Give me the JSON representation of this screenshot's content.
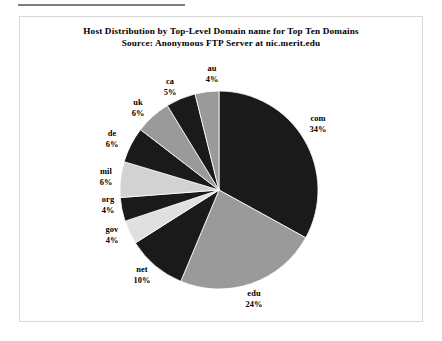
{
  "document": {
    "rule_present": true,
    "frame_present": true
  },
  "chart_data": {
    "type": "pie",
    "title": "Host Distribution by Top-Level Domain name for Top Ten Domains",
    "subtitle": "Source: Anonymous FTP Server at nic.merit.edu",
    "xlabel": "",
    "ylabel": "",
    "units": "percent",
    "legend": "none",
    "grid": false,
    "start_angle_deg": 0,
    "direction": "clockwise",
    "categories": [
      "com",
      "edu",
      "net",
      "gov",
      "org",
      "mil",
      "de",
      "uk",
      "ca",
      "au"
    ],
    "values": [
      34,
      24,
      10,
      4,
      4,
      6,
      6,
      6,
      5,
      4
    ],
    "value_labels": [
      "34%",
      "24%",
      "10%",
      "4%",
      "4%",
      "6%",
      "6%",
      "6%",
      "5%",
      "4%"
    ],
    "colors": [
      "#1a1a1a",
      "#9a9a9a",
      "#1a1a1a",
      "#e0e0e0",
      "#1a1a1a",
      "#d2d2d2",
      "#1a1a1a",
      "#9a9a9a",
      "#1a1a1a",
      "#9a9a9a"
    ],
    "slices": [
      {
        "name": "com",
        "value": 34,
        "label": "com",
        "pct": "34%",
        "color": "#1a1a1a"
      },
      {
        "name": "edu",
        "value": 24,
        "label": "edu",
        "pct": "24%",
        "color": "#9a9a9a"
      },
      {
        "name": "net",
        "value": 10,
        "label": "net",
        "pct": "10%",
        "color": "#1a1a1a"
      },
      {
        "name": "gov",
        "value": 4,
        "label": "gov",
        "pct": "4%",
        "color": "#e0e0e0"
      },
      {
        "name": "org",
        "value": 4,
        "label": "org",
        "pct": "4%",
        "color": "#1a1a1a"
      },
      {
        "name": "mil",
        "value": 6,
        "label": "mil",
        "pct": "6%",
        "color": "#d2d2d2"
      },
      {
        "name": "de",
        "value": 6,
        "label": "de",
        "pct": "6%",
        "color": "#1a1a1a"
      },
      {
        "name": "uk",
        "value": 6,
        "label": "uk",
        "pct": "6%",
        "color": "#9a9a9a"
      },
      {
        "name": "ca",
        "value": 5,
        "label": "ca",
        "pct": "5%",
        "color": "#1a1a1a"
      },
      {
        "name": "au",
        "value": 4,
        "label": "au",
        "pct": "4%",
        "color": "#9a9a9a"
      }
    ]
  }
}
